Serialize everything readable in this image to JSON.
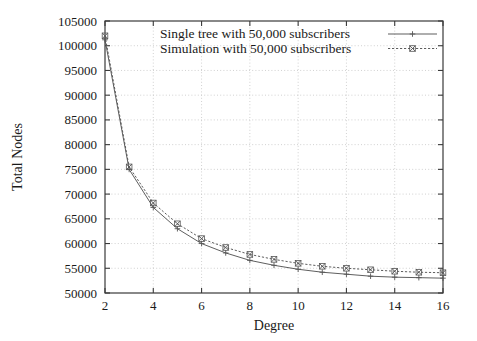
{
  "chart_data": {
    "type": "line",
    "title": "",
    "xlabel": "Degree",
    "ylabel": "Total Nodes",
    "xlim": [
      2,
      16
    ],
    "ylim": [
      50000,
      105000
    ],
    "xticks": [
      2,
      4,
      6,
      8,
      10,
      12,
      14,
      16
    ],
    "xtick_labels": [
      "2",
      "4",
      "6",
      "8",
      "10",
      "12",
      "14",
      "16"
    ],
    "yticks": [
      50000,
      55000,
      60000,
      65000,
      70000,
      75000,
      80000,
      85000,
      90000,
      95000,
      100000,
      105000
    ],
    "ytick_labels": [
      "50000",
      "55000",
      "60000",
      "65000",
      "70000",
      "75000",
      "80000",
      "85000",
      "90000",
      "95000",
      "100000",
      "105000"
    ],
    "grid": true,
    "legend_position": "top-right",
    "x": [
      2,
      3,
      4,
      5,
      6,
      7,
      8,
      9,
      10,
      11,
      12,
      13,
      14,
      15,
      16
    ],
    "series": [
      {
        "name": "Single tree with 50,000 subscribers",
        "marker": "plus",
        "linestyle": "solid",
        "color": "#555555",
        "values": [
          101200,
          75000,
          67300,
          63000,
          60000,
          58100,
          56600,
          55600,
          54800,
          54200,
          53800,
          53400,
          53200,
          53100,
          53000
        ]
      },
      {
        "name": "Simulation with 50,000 subscribers",
        "marker": "cross-box",
        "linestyle": "dotted",
        "color": "#555555",
        "values": [
          102000,
          75500,
          68200,
          64000,
          61000,
          59200,
          57800,
          56800,
          56000,
          55400,
          55000,
          54700,
          54400,
          54200,
          54100
        ]
      }
    ]
  },
  "legend": {
    "entries": [
      {
        "label": "Single tree with 50,000 subscribers"
      },
      {
        "label": "Simulation with 50,000 subscribers"
      }
    ]
  },
  "axes": {
    "x_title": "Degree",
    "y_title": "Total Nodes"
  }
}
